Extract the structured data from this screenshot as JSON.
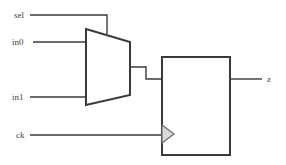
{
  "diagram": {
    "type": "logic-circuit",
    "inputs": [
      {
        "label": "sel"
      },
      {
        "label": "in0"
      },
      {
        "label": "in1"
      },
      {
        "label": "ck"
      }
    ],
    "outputs": [
      {
        "label": "z"
      }
    ],
    "components": [
      {
        "name": "multiplexer",
        "shape": "trapezoid"
      },
      {
        "name": "flip-flop",
        "shape": "rectangle",
        "clock_marker": "triangle"
      }
    ],
    "colors": {
      "line": "#3a3a3a",
      "text": "#444444",
      "clock_triangle_fill": "#d9d9d9",
      "background": "#ffffff"
    }
  }
}
